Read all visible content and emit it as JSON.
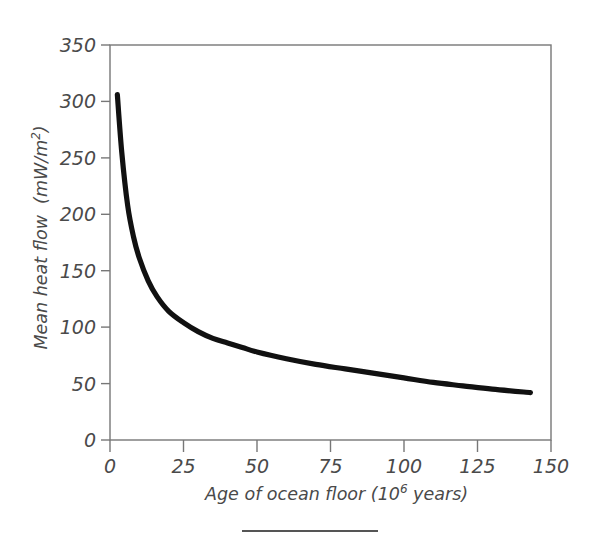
{
  "figure": {
    "background_color": "#ffffff",
    "frame_color": "#777777",
    "curve_color": "#111111",
    "text_color": "#4a4a4a",
    "rule_label": "figure-separator-rule"
  },
  "chart_data": {
    "type": "line",
    "title": "",
    "subtitle": "",
    "xlabel_parts": {
      "base": "Age of ocean floor (10",
      "exponent": "6",
      "tail": " years)"
    },
    "xlabel": "Age of ocean floor (10^6 years)",
    "ylabel_parts": {
      "base": "Mean heat flow  (mW/m",
      "exponent": "2",
      "tail": ")"
    },
    "ylabel": "Mean heat flow (mW/m^2)",
    "xlim": [
      0,
      150
    ],
    "ylim": [
      0,
      350
    ],
    "xticks": [
      0,
      25,
      50,
      75,
      100,
      125,
      150
    ],
    "yticks": [
      0,
      50,
      100,
      150,
      200,
      250,
      300,
      350
    ],
    "xtick_labels": [
      "0",
      "25",
      "50",
      "75",
      "100",
      "125",
      "150"
    ],
    "ytick_labels": [
      "0",
      "50",
      "100",
      "150",
      "200",
      "250",
      "300",
      "350"
    ],
    "grid": false,
    "legend": null,
    "legend_position": "none",
    "series": [
      {
        "name": "Mean heat flow",
        "x": [
          2.5,
          4,
          6,
          8,
          10,
          13,
          16,
          20,
          25,
          30,
          35,
          40,
          45,
          50,
          60,
          70,
          80,
          90,
          100,
          110,
          120,
          130,
          143
        ],
        "values": [
          306,
          255,
          208,
          180,
          161,
          141,
          127,
          114,
          104,
          96,
          90,
          86,
          82,
          78,
          72,
          67,
          63,
          59,
          55,
          51,
          48,
          45,
          42
        ]
      }
    ],
    "annotations": []
  }
}
